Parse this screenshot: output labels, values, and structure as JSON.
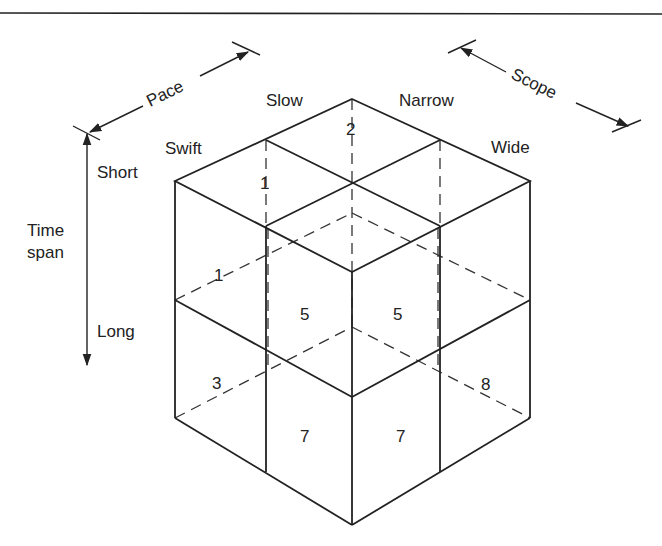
{
  "diagram": {
    "axes": {
      "pace": {
        "label": "Pace",
        "ends": [
          "Swift",
          "Slow"
        ]
      },
      "scope": {
        "label": "Scope",
        "ends": [
          "Narrow",
          "Wide"
        ]
      },
      "time_span": {
        "label_line1": "Time",
        "label_line2": "span",
        "ends": [
          "Short",
          "Long"
        ]
      }
    },
    "end_labels": {
      "slow": "Slow",
      "swift": "Swift",
      "narrow": "Narrow",
      "wide": "Wide",
      "short": "Short",
      "long": "Long"
    },
    "cell_numbers": {
      "top_back": "2",
      "top_left_hidden": "1",
      "left_upper_hidden": "1",
      "front_left_upper": "5",
      "front_right_upper": "5",
      "left_lower_hidden": "3",
      "right_lower_hidden": "8",
      "front_left_lower": "7",
      "front_right_lower": "7"
    }
  }
}
